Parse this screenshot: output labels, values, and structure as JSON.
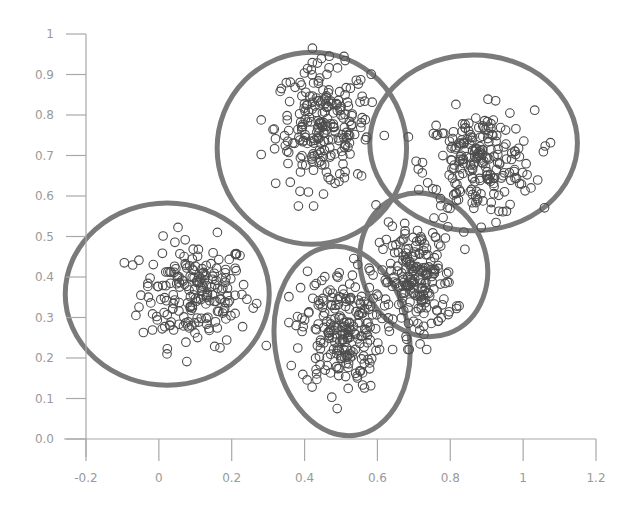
{
  "chart_data": {
    "type": "scatter",
    "title": "",
    "xlabel": "",
    "ylabel": "",
    "xlim": [
      -0.2,
      1.2
    ],
    "ylim": [
      0.0,
      1.0
    ],
    "grid": false,
    "legend": null,
    "x_ticks": [
      "-0.2",
      "0",
      "0.2",
      "0.4",
      "0.6",
      "0.8",
      "1",
      "1.2"
    ],
    "x_tick_values": [
      -0.2,
      0,
      0.2,
      0.4,
      0.6,
      0.8,
      1.0,
      1.2
    ],
    "y_ticks": [
      "0.0",
      "0.1",
      "0.2",
      "0.3",
      "0.4",
      "0.5",
      "0.6",
      "0.7",
      "0.8",
      "0.9",
      "1"
    ],
    "y_tick_values": [
      0.0,
      0.1,
      0.2,
      0.3,
      0.4,
      0.5,
      0.6,
      0.7,
      0.8,
      0.9,
      1.0
    ],
    "marker": "open-circle",
    "clusters": [
      {
        "name": "cluster-1",
        "center": [
          0.1,
          0.36
        ],
        "spread": [
          0.075,
          0.065
        ],
        "count": 200,
        "ellipse": {
          "cx": 0.023,
          "cy": 0.358,
          "rx": 0.28,
          "ry": 0.225,
          "angle": 0
        }
      },
      {
        "name": "cluster-2",
        "center": [
          0.45,
          0.77
        ],
        "spread": [
          0.065,
          0.075
        ],
        "count": 230,
        "ellipse": {
          "cx": 0.42,
          "cy": 0.718,
          "rx": 0.26,
          "ry": 0.237,
          "angle": 0
        }
      },
      {
        "name": "cluster-3",
        "center": [
          0.88,
          0.68
        ],
        "spread": [
          0.075,
          0.065
        ],
        "count": 220,
        "ellipse": {
          "cx": 0.864,
          "cy": 0.731,
          "rx": 0.285,
          "ry": 0.217,
          "angle": 0
        }
      },
      {
        "name": "cluster-4",
        "center": [
          0.5,
          0.27
        ],
        "spread": [
          0.055,
          0.075
        ],
        "count": 220,
        "ellipse": {
          "cx": 0.503,
          "cy": 0.242,
          "rx": 0.185,
          "ry": 0.235,
          "angle": -8
        }
      },
      {
        "name": "cluster-5",
        "center": [
          0.71,
          0.39
        ],
        "spread": [
          0.05,
          0.065
        ],
        "count": 200,
        "ellipse": {
          "cx": 0.727,
          "cy": 0.43,
          "rx": 0.172,
          "ry": 0.18,
          "angle": -20
        }
      }
    ]
  },
  "colors": {
    "background": "#ffffff",
    "axis": "#a8a8a8",
    "tick_label": "#9a9a9a",
    "marker": "#4d4d4d",
    "ellipse": "#7a7a7a"
  }
}
